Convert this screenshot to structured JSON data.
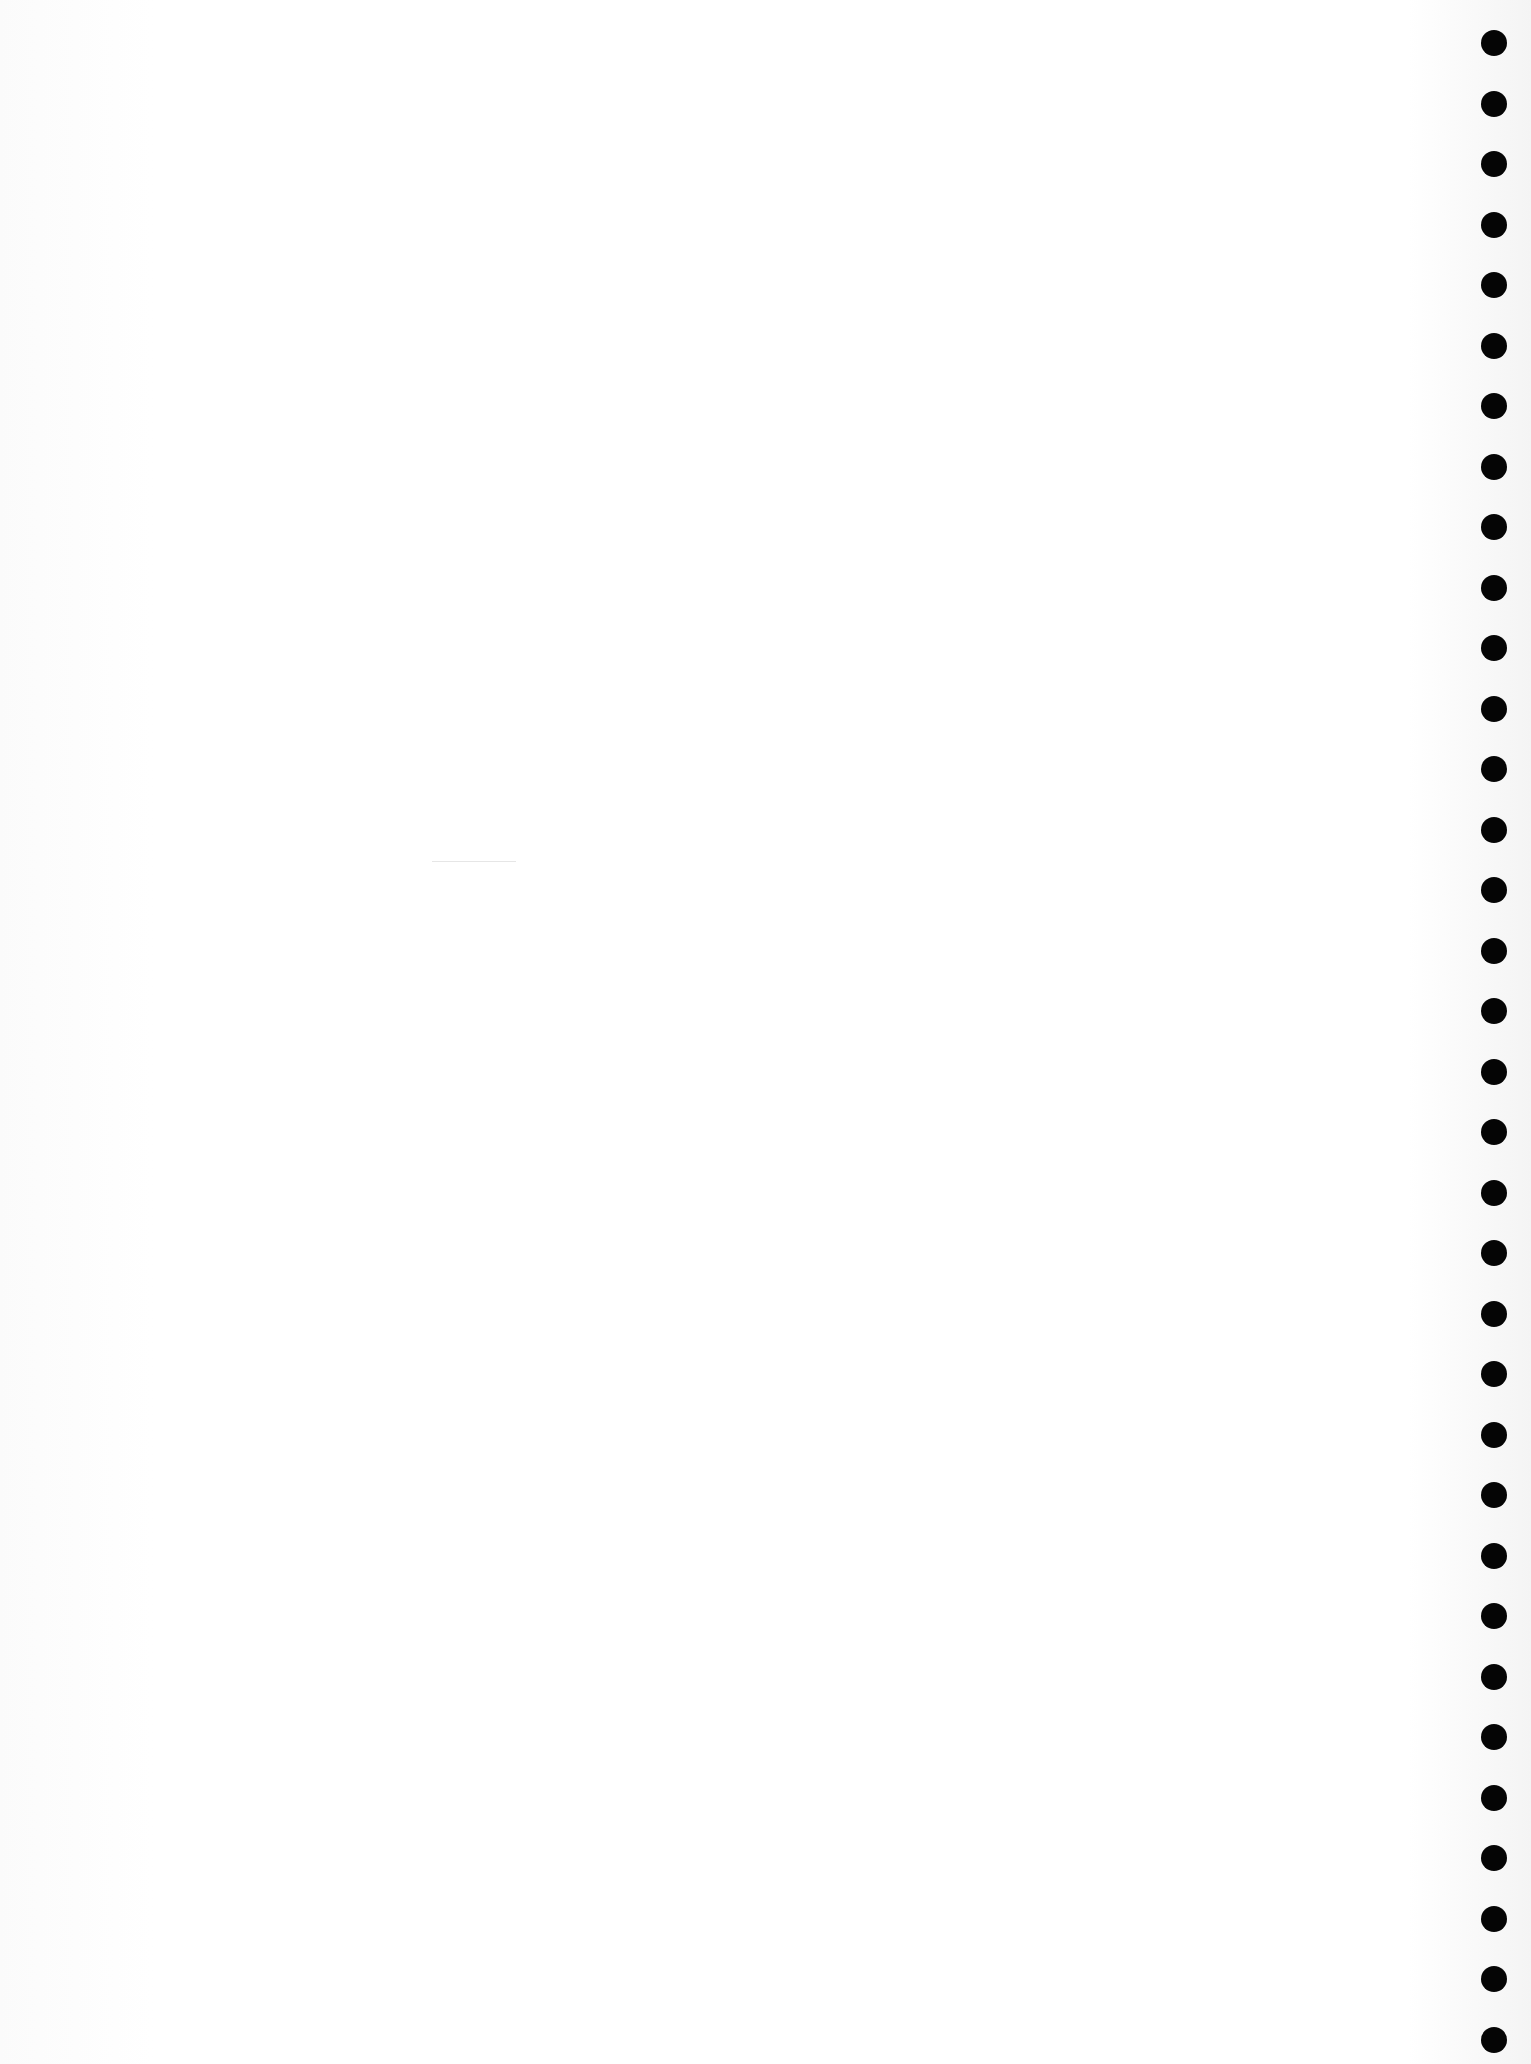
{
  "document": {
    "type": "blank-punched-sheet",
    "background_color": "#ffffff",
    "hole_color": "#050505",
    "holes": {
      "count": 34,
      "first_center_y": 43,
      "spacing": 60.5,
      "center_x": 1494,
      "diameter": 26
    }
  }
}
